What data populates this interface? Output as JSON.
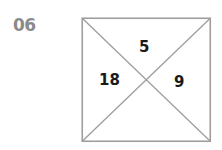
{
  "page": {
    "width": 222,
    "height": 150,
    "background_color": "#ffffff"
  },
  "problem": {
    "number_label": "06"
  },
  "figure": {
    "shape_name": "square-with-diagonals",
    "stroke_color": "#9e9e9e",
    "fill_color": "#ffffff",
    "text_color": "#1a1a1a",
    "label_color": "#8a8a8a",
    "quadrants": {
      "top": "5",
      "left": "18",
      "right": "9",
      "bottom": ""
    }
  }
}
